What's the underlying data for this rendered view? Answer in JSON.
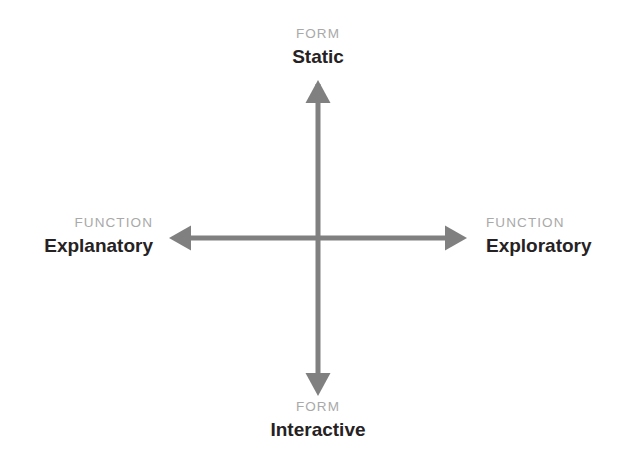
{
  "diagram": {
    "background_color": "#ffffff",
    "axis_color": "#808080",
    "kicker_color": "#a9a9a9",
    "term_color": "#262223",
    "axes": [
      {
        "name": "form-axis",
        "orientation": "vertical",
        "dimension_label": "FORM",
        "poles": [
          "Static",
          "Interactive"
        ]
      },
      {
        "name": "function-axis",
        "orientation": "horizontal",
        "dimension_label": "FUNCTION",
        "poles": [
          "Explanatory",
          "Exploratory"
        ]
      }
    ],
    "labels": {
      "top": {
        "kicker": "FORM",
        "term": "Static"
      },
      "bottom": {
        "kicker": "FORM",
        "term": "Interactive"
      },
      "left": {
        "kicker": "FUNCTION",
        "term": "Explanatory"
      },
      "right": {
        "kicker": "FUNCTION",
        "term": "Exploratory"
      }
    }
  }
}
